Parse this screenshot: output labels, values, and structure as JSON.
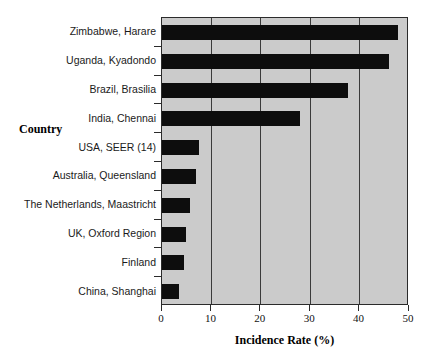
{
  "chart_data": {
    "type": "bar",
    "orientation": "horizontal",
    "title": "",
    "xlabel": "Incidence Rate (%)",
    "ylabel": "Country",
    "xlim": [
      0,
      50
    ],
    "xticks": [
      0,
      10,
      20,
      30,
      40,
      50
    ],
    "xticklabels": [
      "0",
      "10",
      "20",
      "30",
      "40",
      "50"
    ],
    "grid": "vertical",
    "legend": "none",
    "categories": [
      "Zimbabwe, Harare",
      "Uganda, Kyadondo",
      "Brazil, Brasilia",
      "India, Chennai",
      "USA, SEER (14)",
      "Australia, Queensland",
      "The Netherlands, Maastricht",
      "UK, Oxford Region",
      "Finland",
      "China, Shanghai"
    ],
    "values": [
      47.8,
      46.0,
      37.6,
      28.0,
      7.4,
      6.9,
      5.7,
      4.8,
      4.4,
      3.4
    ],
    "bar_color": "#0d0d0d",
    "plot_background": "#cbcbcb"
  }
}
